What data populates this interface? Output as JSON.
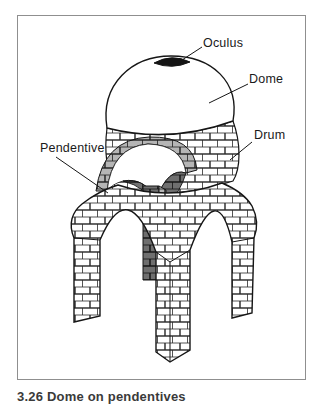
{
  "figure": {
    "labels": {
      "oculus": "Oculus",
      "dome": "Dome",
      "drum": "Drum",
      "pendentive": "Pendentive"
    },
    "caption": "3.26 Dome on pendentives",
    "colors": {
      "line": "#1a1a1a",
      "frame_border": "#8f8f8f",
      "background": "#ffffff",
      "oculus_fill": "#141414",
      "arch_band_shade": "#b5b5b5",
      "pendentive_shade": "#6f6f6f"
    }
  }
}
